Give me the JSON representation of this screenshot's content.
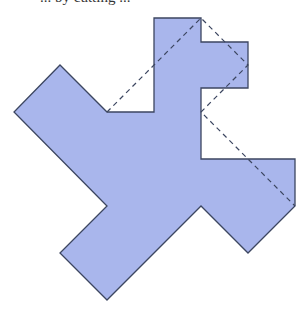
{
  "caption": {
    "text": "... by cutting ...",
    "note": "partially cropped at top edge"
  },
  "figure": {
    "fill_color": "#a9b6ec",
    "stroke_color": "#3c4660",
    "dash_color": "#3c4660",
    "polygon_points": "154,18 201,18 201,42 248,42 248,88 201,88 201,159 295,159 295,206 248,253 201,206 107,300 60,253 107,206 14,112 60,65 107,112 154,112",
    "dashed_path_points": "107,112 201,18 248,65 201,112 295,206"
  }
}
